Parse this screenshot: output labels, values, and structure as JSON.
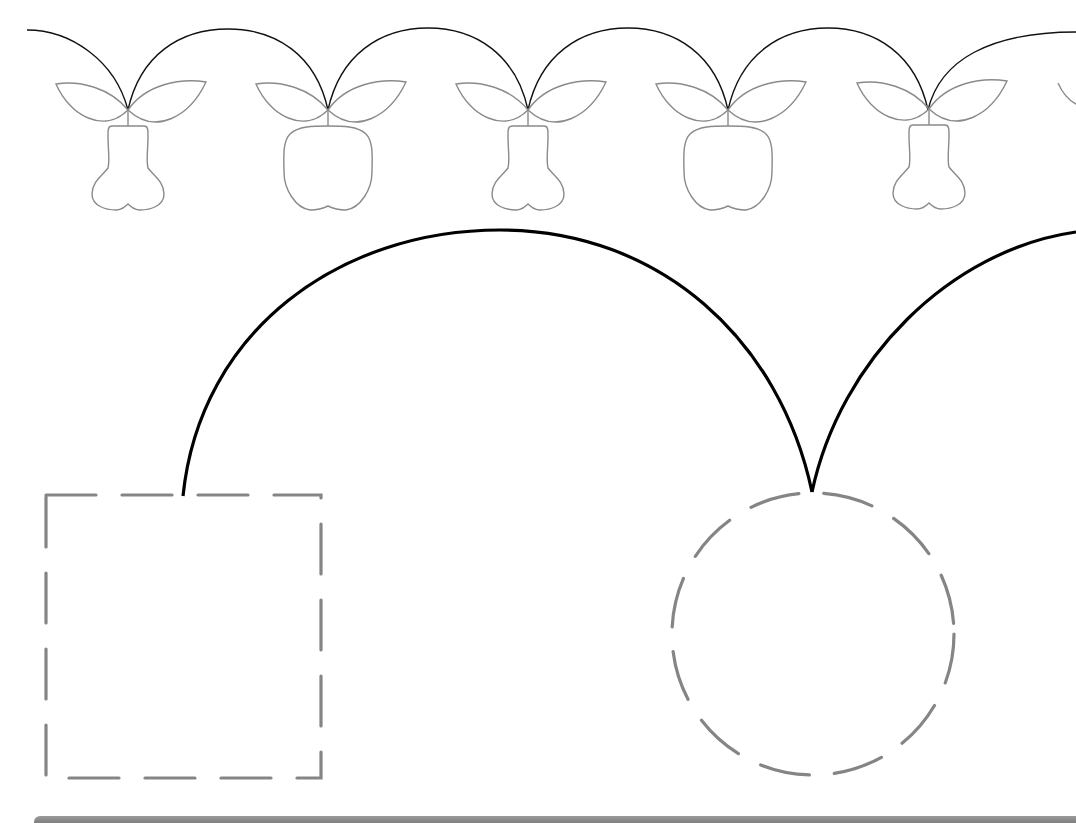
{
  "worksheet": {
    "type": "tracing-exercise",
    "top_row": {
      "items": [
        {
          "kind": "pear"
        },
        {
          "kind": "apple"
        },
        {
          "kind": "pear"
        },
        {
          "kind": "apple"
        },
        {
          "kind": "pear"
        },
        {
          "kind": "leaf-partial"
        }
      ],
      "connector": "arc"
    },
    "main_path": {
      "start_shape": "dashed-square",
      "end_shape": "dashed-circle",
      "connector": "large-arc",
      "continues_right": true
    },
    "colors": {
      "fruit_outline": "#8a8a8a",
      "arc": "#000000",
      "dashed_outline": "#858585",
      "bottom_bar": "#8c8c8c",
      "background": "#ffffff"
    }
  }
}
